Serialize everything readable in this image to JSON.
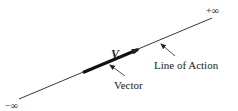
{
  "diagram": {
    "labels": {
      "plus_infinity": "+∞",
      "minus_infinity": "−∞",
      "vector_symbol": "V",
      "vector_caption": "Vector",
      "line_caption": "Line of Action"
    },
    "colors": {
      "line": "#222222",
      "background": "#ffffff"
    }
  }
}
